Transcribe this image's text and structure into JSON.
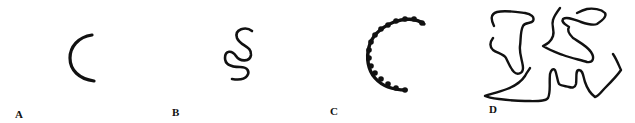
{
  "figure": {
    "panels": [
      {
        "id": "A",
        "label": "A",
        "description": "smooth rigid arc (C-shaped rod)"
      },
      {
        "id": "B",
        "label": "B",
        "description": "flexible S-shaped coil"
      },
      {
        "id": "C",
        "label": "C",
        "description": "beaded semi-flexible arc"
      },
      {
        "id": "D",
        "label": "D",
        "description": "multiple random-coil chains"
      }
    ],
    "colors": {
      "stroke": "#111111",
      "background": "#ffffff"
    }
  }
}
